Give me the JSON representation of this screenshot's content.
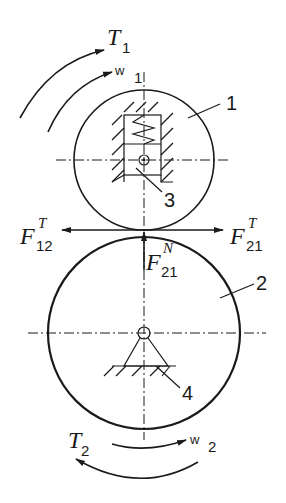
{
  "diagram": {
    "type": "friction wheel transmission free-body diagram",
    "components": [
      {
        "id": "1",
        "label": "1",
        "description": "upper driving wheel"
      },
      {
        "id": "2",
        "label": "2",
        "description": "lower driven wheel"
      },
      {
        "id": "3",
        "label": "3",
        "description": "spring-loaded slider/bearing housing"
      },
      {
        "id": "4",
        "label": "4",
        "description": "fixed pin support"
      }
    ],
    "labels": {
      "torque1": {
        "main": "T",
        "sub": "1"
      },
      "omega1": {
        "main": "w",
        "sub": "1"
      },
      "torque2": {
        "main": "T",
        "sub": "2"
      },
      "omega2": {
        "main": "w",
        "sub": "2"
      },
      "force12T": {
        "main": "F",
        "sub": "12",
        "sup": "T"
      },
      "force21T": {
        "main": "F",
        "sub": "21",
        "sup": "T"
      },
      "force21N": {
        "main": "F",
        "sub": "21",
        "sup": "N"
      }
    },
    "colors": {
      "stroke": "#1a1a1a",
      "background": "#ffffff"
    }
  }
}
